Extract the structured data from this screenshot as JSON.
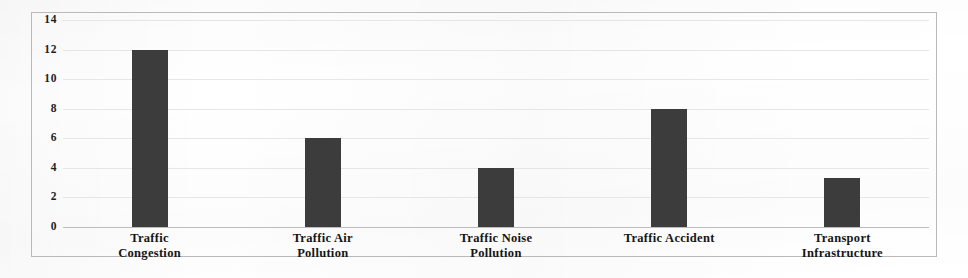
{
  "chart_data": {
    "type": "bar",
    "title": "",
    "subtitle": "",
    "xlabel": "",
    "ylabel": "",
    "categories": [
      "Traffic Congestion",
      "Traffic Air Pollution",
      "Traffic Noise Pollution",
      "Traffic Accident",
      "Transport Infrastructure"
    ],
    "category_lines": [
      [
        "Traffic",
        "Congestion"
      ],
      [
        "Traffic Air",
        "Pollution"
      ],
      [
        "Traffic Noise",
        "Pollution"
      ],
      [
        "Traffic Accident",
        ""
      ],
      [
        "Transport",
        "Infrastructure"
      ]
    ],
    "values": [
      12,
      6,
      4,
      8,
      3.3
    ],
    "ylim": [
      0,
      14
    ],
    "yticks": [
      0,
      2,
      4,
      6,
      8,
      10,
      12,
      14
    ],
    "ytick_labels": [
      "0",
      "2",
      "4",
      "6",
      "8",
      "10",
      "12",
      "14"
    ],
    "grid": true,
    "legend": false,
    "bar_color": "#3c3c3c",
    "grid_color": "#d8d8d8",
    "frame_color": "#b9b9b9",
    "background_color": "#ffffff"
  }
}
